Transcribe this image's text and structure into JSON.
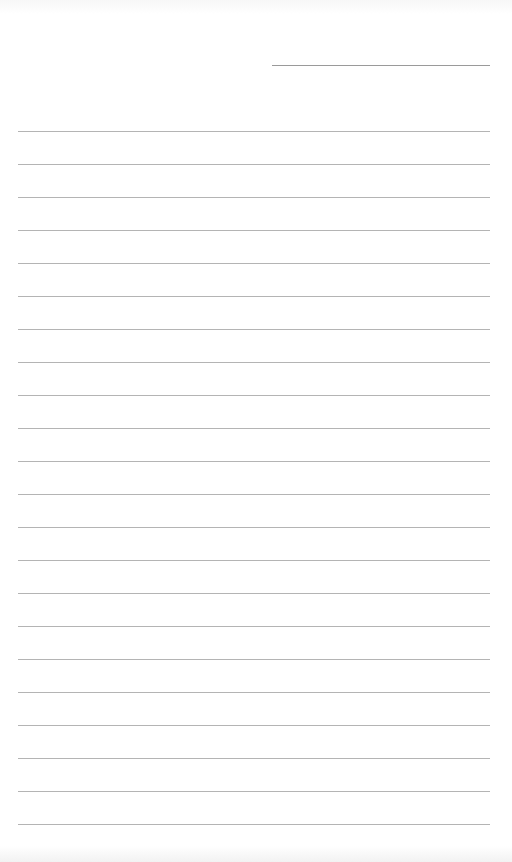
{
  "document": {
    "type": "blank-lined-page",
    "header_line": {
      "visible": true
    },
    "ruled_lines": {
      "count": 22,
      "first_y": 131,
      "spacing": 33,
      "color": "#b4b4b4"
    },
    "text_content": []
  }
}
